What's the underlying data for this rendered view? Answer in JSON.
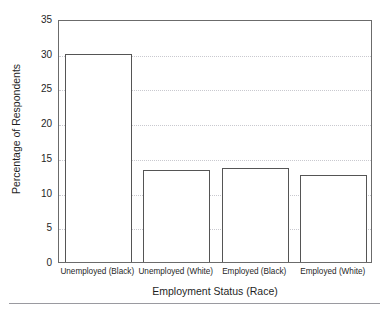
{
  "page": {
    "caption_remnant": "",
    "bottom_rule_color": "#9a9aa0",
    "background": "#ffffff"
  },
  "chart_data": {
    "type": "bar",
    "title": "",
    "subtitle": "",
    "xlabel": "Employment Status (Race)",
    "ylabel": "Percentage of Respondents",
    "categories": [
      "Unemployed (Black)",
      "Unemployed (White)",
      "Employed (Black)",
      "Employed (White)"
    ],
    "values": [
      30.0,
      13.2,
      13.5,
      12.6
    ],
    "ylim": [
      0,
      35
    ],
    "yticks": [
      0,
      5,
      10,
      15,
      20,
      25,
      30,
      35
    ],
    "ytick_labels": [
      "0",
      "5",
      "10",
      "15",
      "20",
      "25",
      "30",
      "35"
    ],
    "grid": true,
    "grid_axis": "y",
    "grid_style": "dotted",
    "grid_color": "#c9c9cf",
    "legend": false,
    "legend_position": "none",
    "bar_fill": "#ffffff",
    "bar_edge_color": "#555555",
    "axis_color": "#6b6b6b",
    "text_color": "#1f1f1f"
  }
}
